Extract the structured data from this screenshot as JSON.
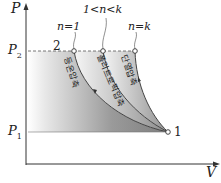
{
  "diagram": {
    "type": "P-V diagram",
    "axes": {
      "y_label": "P",
      "x_label": "V"
    },
    "pressure_levels": {
      "high": "P",
      "high_sub": "2",
      "low": "P",
      "low_sub": "1"
    },
    "points": {
      "start": "1",
      "end": "2"
    },
    "curve_indices": {
      "isothermal": "n=1",
      "polytropic": "1<n<k",
      "adiabatic": "n=k"
    },
    "curve_labels": {
      "isothermal": "등온압축",
      "polytropic": "폴리트로픽압축",
      "adiabatic": "단열압축"
    },
    "colors": {
      "axis": "#333333",
      "fill_dark": "#7a7a7a",
      "fill_light": "#f2f2f2",
      "curve": "#444444"
    }
  }
}
